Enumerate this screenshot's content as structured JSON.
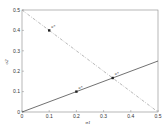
{
  "chart_data": {
    "type": "line",
    "title": "",
    "xlabel": "σ1",
    "ylabel": "σ2",
    "xlim": [
      0,
      0.5
    ],
    "ylim": [
      0,
      0.5
    ],
    "grid": false,
    "xticks": [
      "0",
      "0.1",
      "0.2",
      "0.3",
      "0.4",
      "0.5"
    ],
    "yticks": [
      "0",
      "0.1",
      "0.2",
      "0.3",
      "0.4",
      "0.5"
    ],
    "series": [
      {
        "name": "solid-line",
        "style": "solid",
        "x": [
          0,
          0.5
        ],
        "y": [
          0,
          0.25
        ],
        "color": "#333333"
      },
      {
        "name": "dash-dot-line",
        "style": "dashdot",
        "x": [
          0,
          0.5
        ],
        "y": [
          0.5,
          0
        ],
        "color": "#9a9a9a"
      }
    ],
    "points": [
      {
        "x": 0.1,
        "y": 0.4,
        "label": "u*"
      },
      {
        "x": 0.2,
        "y": 0.1,
        "label": "u*"
      },
      {
        "x": 0.3333,
        "y": 0.1667,
        "label": "u*"
      }
    ]
  }
}
